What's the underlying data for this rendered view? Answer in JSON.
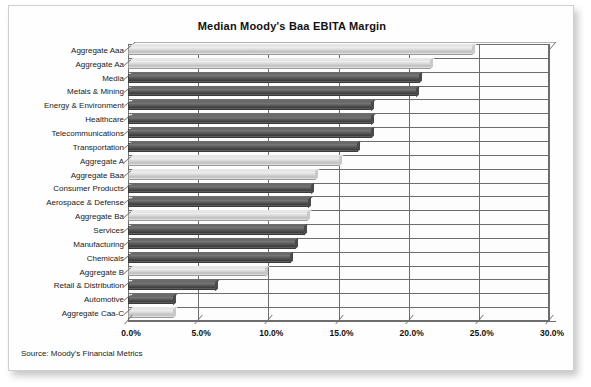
{
  "chart_data": {
    "type": "bar",
    "orientation": "horizontal",
    "title": "Median Moody's Baa EBITA Margin",
    "source": "Source: Moody's Financial Metrics",
    "xlabel": "",
    "ylabel": "",
    "xlim": [
      0,
      30
    ],
    "xtick_labels": [
      "0.0%",
      "5.0%",
      "10.0%",
      "15.0%",
      "20.0%",
      "25.0%",
      "30.0%"
    ],
    "xtick_values": [
      0,
      5,
      10,
      15,
      20,
      25,
      30
    ],
    "grid": true,
    "legend": "none",
    "value_unit": "percent",
    "categories": [
      "Aggregate Aaa",
      "Aggregate Aa",
      "Media",
      "Metals & Mining",
      "Energy & Environment",
      "Healthcare",
      "Telecommunications",
      "Transportation",
      "Aggregate A",
      "Aggregate Baa",
      "Consumer Products",
      "Aerospace & Defense",
      "Aggregate Ba",
      "Services",
      "Manufacturing",
      "Chemicals",
      "Aggregate B",
      "Retail & Distribution",
      "Automotive",
      "Aggregate Caa-C"
    ],
    "values": [
      24.6,
      21.6,
      20.8,
      20.6,
      17.4,
      17.4,
      17.4,
      16.4,
      15.1,
      13.4,
      13.1,
      12.9,
      12.8,
      12.6,
      12.0,
      11.6,
      9.8,
      6.3,
      3.3,
      3.3
    ],
    "series": [
      {
        "name": "Median EBITA Margin",
        "values": [
          24.6,
          21.6,
          20.8,
          20.6,
          17.4,
          17.4,
          17.4,
          16.4,
          15.1,
          13.4,
          13.1,
          12.9,
          12.8,
          12.6,
          12.0,
          11.6,
          9.8,
          6.3,
          3.3,
          3.3
        ]
      }
    ],
    "bar_styles": [
      "light",
      "light",
      "dark",
      "dark",
      "dark",
      "dark",
      "dark",
      "dark",
      "light",
      "light",
      "dark",
      "dark",
      "light",
      "dark",
      "dark",
      "dark",
      "light",
      "dark",
      "dark",
      "light"
    ],
    "colors": {
      "bar_light": "#d8d8d8",
      "bar_dark": "#4a4a4a",
      "grid": "#6d6d6d",
      "text": "#111111",
      "plot_background": "#fdfdfd",
      "card_background": "#fefefe"
    }
  }
}
